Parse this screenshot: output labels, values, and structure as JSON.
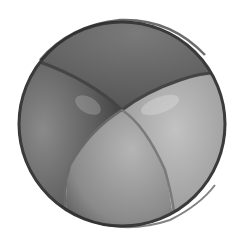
{
  "image": {
    "subject": "Grayscale watercolor illustration of a four-panel ball",
    "colors": {
      "background": "#ffffff",
      "outline": "#3a3a3a",
      "panel_top": "#6e6e6e",
      "panel_left": "#5e5e5e",
      "panel_right": "#a9a9a9",
      "panel_bottom": "#9a9a9a",
      "seam": "#4a4a4a"
    }
  }
}
